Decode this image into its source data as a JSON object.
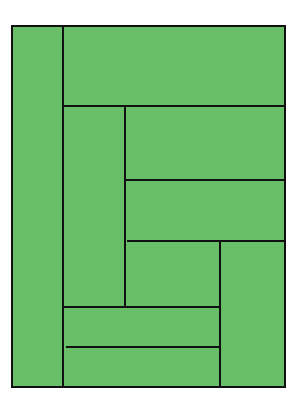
{
  "diagram": {
    "type": "rectangle-dissection",
    "fill_color": "#68bf68",
    "line_color": "#111111",
    "outer": {
      "x": 11,
      "y": 25,
      "w": 275,
      "h": 363
    },
    "lines": [
      {
        "orient": "v",
        "x": 63,
        "y1": 25,
        "y2": 388
      },
      {
        "orient": "h",
        "y": 106,
        "x1": 63,
        "x2": 286
      },
      {
        "orient": "v",
        "x": 125,
        "y1": 106,
        "y2": 307
      },
      {
        "orient": "h",
        "y": 180,
        "x1": 125,
        "x2": 286
      },
      {
        "orient": "h",
        "y": 241,
        "x1": 127,
        "x2": 286
      },
      {
        "orient": "v",
        "x": 220,
        "y1": 241,
        "y2": 388
      },
      {
        "orient": "h",
        "y": 307,
        "x1": 63,
        "x2": 221
      },
      {
        "orient": "h",
        "y": 347,
        "x1": 66,
        "x2": 221
      }
    ]
  }
}
